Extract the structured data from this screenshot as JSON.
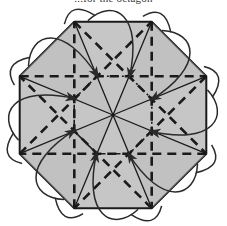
{
  "page": {
    "background_color": "#ffffff",
    "width": 227,
    "height": 226
  },
  "caption": {
    "text": "...for the octagon",
    "note": "clipped at top edge of image; only letter bottoms visible",
    "color": "#3a3a3a"
  },
  "figure": {
    "name": "octagon-symmetry-diagram",
    "colors": {
      "fill": "#c6c6c6",
      "fill_shade": "#bdbdbd",
      "stroke": "#1a1a1a",
      "arrow": "#2a2a2a"
    },
    "geometry": {
      "center_x": 113,
      "center_y": 115,
      "outer_radius": 101,
      "inner_radius": 42,
      "sides": 8,
      "rotation_deg": 22.5,
      "arrow_count": 8,
      "spoke_count": 8,
      "diagonal_count": 8
    },
    "stroke_widths": {
      "outline": 2.0,
      "spoke": 1.3,
      "diagonal": 2.6,
      "inner": 1.6,
      "arrow": 1.5
    },
    "dash_patterns": {
      "diagonal": "9,6",
      "inner_octagon": "7,3,2,3"
    }
  },
  "chart_data": {
    "type": "diagram",
    "shape": "regular octagon",
    "vertices": 8,
    "elements": [
      "outer octagon outline (solid)",
      "8 radial spokes (solid, center to vertices)",
      "inner octagon (dash-dot)",
      "8 skip-diagonals (long dashed)",
      "8 curved arrows looping around each vertex"
    ]
  }
}
